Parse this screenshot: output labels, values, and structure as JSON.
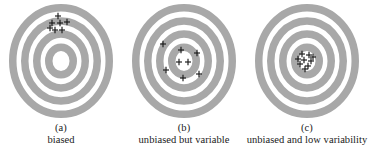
{
  "figure": {
    "name": "bias-and-variability-targets",
    "background_color": "#ffffff",
    "ring_color": "#a8a8a8",
    "gap_color": "#ffffff",
    "mark_color": "#1a1a1a",
    "mark_glyph": "plus",
    "target_geometry": {
      "cx": 61,
      "cy": 61,
      "rx_outer": 52,
      "ry_outer": 57,
      "ring_band_width": 7.5,
      "gap_width": 4.5,
      "ring_count": 4,
      "bullseye_hole_rx": 6,
      "bullseye_hole_ry": 6.6
    },
    "panels": [
      {
        "id": "a",
        "letter": "(a)",
        "label": "biased",
        "marks": [
          {
            "x": 58,
            "y": 16
          },
          {
            "x": 52,
            "y": 23
          },
          {
            "x": 60,
            "y": 23
          },
          {
            "x": 67,
            "y": 22
          },
          {
            "x": 55,
            "y": 30
          },
          {
            "x": 62,
            "y": 30
          },
          {
            "x": 50,
            "y": 28
          }
        ]
      },
      {
        "id": "b",
        "letter": "(b)",
        "label": "unbiased but variable",
        "marks": [
          {
            "x": 40,
            "y": 44
          },
          {
            "x": 58,
            "y": 50
          },
          {
            "x": 74,
            "y": 53
          },
          {
            "x": 56,
            "y": 62
          },
          {
            "x": 65,
            "y": 62
          },
          {
            "x": 43,
            "y": 70
          },
          {
            "x": 76,
            "y": 74
          },
          {
            "x": 60,
            "y": 78
          }
        ]
      },
      {
        "id": "c",
        "letter": "(c)",
        "label": "unbiased and low variability",
        "marks": [
          {
            "x": 56,
            "y": 54
          },
          {
            "x": 63,
            "y": 55
          },
          {
            "x": 58,
            "y": 60
          },
          {
            "x": 65,
            "y": 61
          },
          {
            "x": 54,
            "y": 64
          },
          {
            "x": 62,
            "y": 66
          },
          {
            "x": 67,
            "y": 57
          },
          {
            "x": 59,
            "y": 69
          },
          {
            "x": 52,
            "y": 59
          }
        ]
      }
    ]
  }
}
